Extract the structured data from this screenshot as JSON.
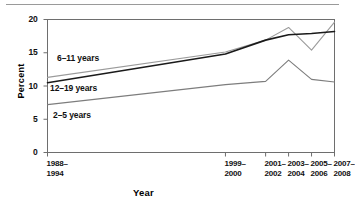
{
  "chart_data": {
    "type": "line",
    "title": "",
    "xlabel": "Year",
    "ylabel": "Percent",
    "ylim": [
      0,
      20
    ],
    "yticks": [
      0,
      5,
      10,
      15,
      20
    ],
    "ytick_labels": [
      "0",
      "5",
      "10",
      "15",
      "20"
    ],
    "grid": false,
    "legend_position": "inline-labels",
    "categories": [
      "1988–1994",
      "1999–2000",
      "2001–2002",
      "2003–2004",
      "2005–2006",
      "2007–2008"
    ],
    "category_lines": [
      [
        "1988–",
        "1994"
      ],
      [
        "1999–",
        "2000"
      ],
      [
        "2001–",
        "2002"
      ],
      [
        "2003–",
        "2004"
      ],
      [
        "2005–",
        "2006"
      ],
      [
        "2007–",
        "2008"
      ]
    ],
    "x_positions": [
      0,
      0.62,
      0.76,
      0.84,
      0.92,
      1.0
    ],
    "series": [
      {
        "name": "6–11 years",
        "color": "#9b9b9b",
        "values": [
          11.3,
          15.1,
          16.9,
          18.8,
          15.4,
          19.6
        ]
      },
      {
        "name": "12–19 years",
        "color": "#1a1a1a",
        "values": [
          10.5,
          14.8,
          16.9,
          17.7,
          17.9,
          18.2
        ]
      },
      {
        "name": "2–5 years",
        "color": "#7d7d7d",
        "values": [
          7.2,
          10.2,
          10.7,
          13.9,
          11.0,
          10.6
        ]
      }
    ]
  },
  "axis": {
    "y_label": "Percent",
    "x_label": "Year"
  },
  "series_labels": {
    "s6_11": "6–11 years",
    "s12_19": "12–19 years",
    "s2_5": "2–5 years"
  }
}
